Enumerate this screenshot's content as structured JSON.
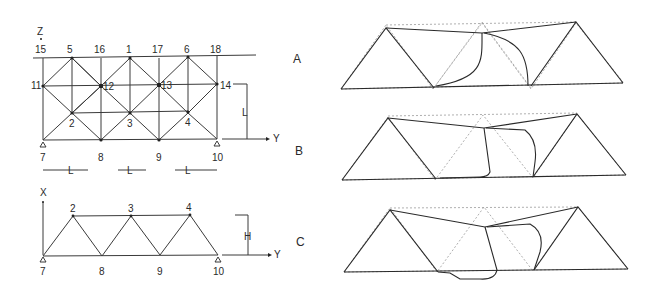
{
  "figure": {
    "top_view": {
      "axis_vertical": "Z",
      "axis_horizontal": "Y",
      "top_nodes": [
        "15",
        "5",
        "16",
        "1",
        "17",
        "6",
        "18"
      ],
      "mid_nodes": [
        "11",
        "12",
        "13",
        "14"
      ],
      "lower_nodes": [
        "2",
        "3",
        "4"
      ],
      "bottom_nodes": [
        "7",
        "8",
        "9",
        "10"
      ],
      "dimension_height": "L",
      "dimension_spans": [
        "L",
        "L",
        "L"
      ]
    },
    "side_view": {
      "axis_vertical": "X",
      "axis_horizontal": "Y",
      "top_nodes": [
        "2",
        "3",
        "4"
      ],
      "bottom_nodes": [
        "7",
        "8",
        "9",
        "10"
      ],
      "dimension_height": "H"
    },
    "mode_labels": [
      "A",
      "B",
      "C"
    ]
  }
}
